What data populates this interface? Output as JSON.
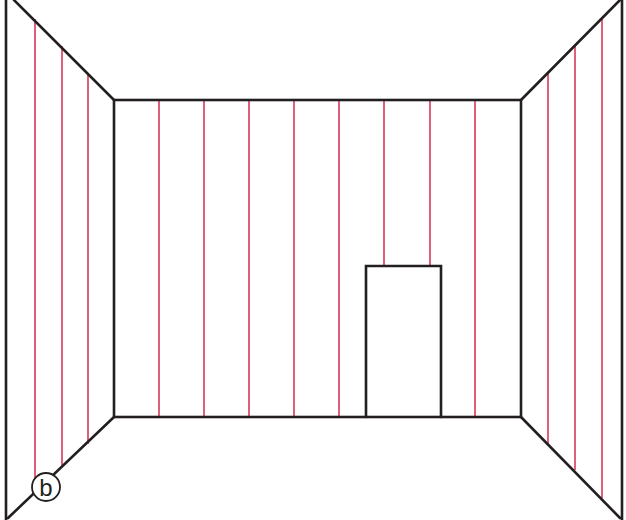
{
  "figure": {
    "label": "b",
    "colors": {
      "outline": "#231f20",
      "stripe": "#e0607a",
      "background": "#ffffff"
    }
  },
  "geometry": {
    "back_wall": {
      "x1": 114,
      "y1": 100,
      "x2": 521,
      "y2": 417
    },
    "door": {
      "x1": 366,
      "y1": 266,
      "x2": 441,
      "y2": 417
    },
    "back_stripes_x": [
      159,
      204,
      249,
      294,
      339,
      384,
      430,
      475
    ],
    "left_stripes_x": [
      35,
      62,
      88
    ],
    "right_stripes_x": [
      548,
      575,
      602
    ]
  }
}
